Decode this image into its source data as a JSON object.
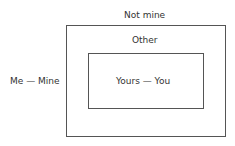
{
  "diagram": {
    "outer_top_label": "Not mine",
    "outer_inner_label": "Other",
    "left_label": "Me — Mine",
    "inner_label": "Yours — You"
  }
}
